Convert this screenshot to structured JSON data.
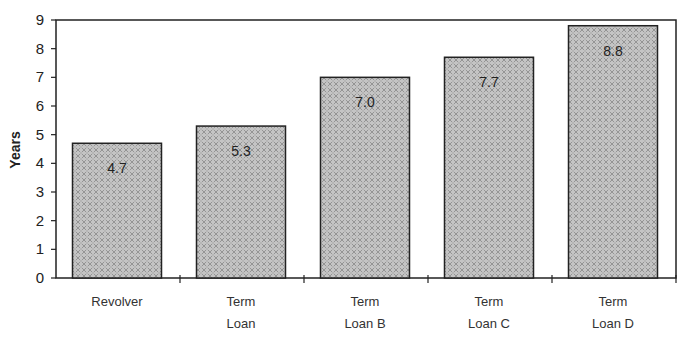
{
  "chart_data": {
    "type": "bar",
    "title": "",
    "xlabel": "",
    "ylabel": "Years",
    "ylim": [
      0,
      9
    ],
    "yticks": [
      0,
      1,
      2,
      3,
      4,
      5,
      6,
      7,
      8,
      9
    ],
    "grid": false,
    "legend": null,
    "categories": [
      "Revolver",
      "Term Loan",
      "Term Loan B",
      "Term Loan C",
      "Term Loan D"
    ],
    "category_label_lines": [
      [
        "Revolver"
      ],
      [
        "Term",
        "Loan"
      ],
      [
        "Term",
        "Loan B"
      ],
      [
        "Term",
        "Loan C"
      ],
      [
        "Term",
        "Loan D"
      ]
    ],
    "values": [
      4.7,
      5.3,
      7.0,
      7.7,
      8.8
    ],
    "value_labels": [
      "4.7",
      "5.3",
      "7.0",
      "7.7",
      "8.8"
    ],
    "colors": {
      "bar_fill": "#bdbdbd",
      "bar_pattern": "#8a8a8a",
      "bar_stroke": "#222222",
      "axis": "#222222"
    }
  }
}
